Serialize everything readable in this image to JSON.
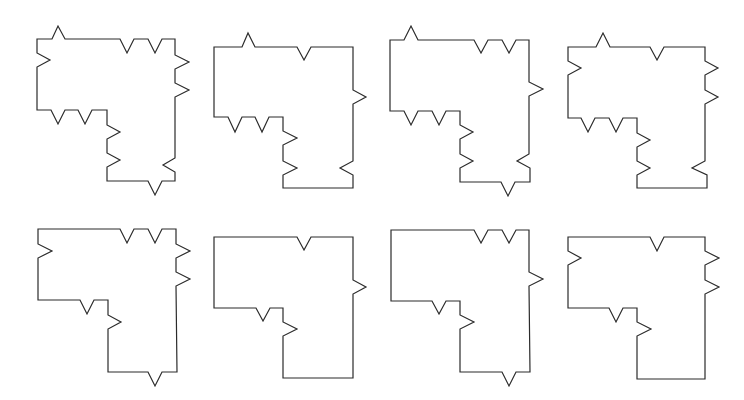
{
  "figure": {
    "width": 744,
    "height": 400,
    "stroke_color": "#2b2b2b",
    "background": "#ffffff"
  },
  "shapes": [
    {
      "id": "shape-1",
      "row": 1,
      "col": 1,
      "points": "37,39 52,39 58,26 65,39 120,39 127,53 134,39 148,39 155,53 162,39 175,39 175,55 189,62 175,69 175,83 189,90 175,97 175,158 163,165 175,172 175,181 162,181 155,195 148,181 107,181 107,167 120,160 107,153 107,139 120,132 107,125 107,110 92,110 85,124 78,110 65,110 58,124 51,110 37,110 37,67 50,60 37,53"
    },
    {
      "id": "shape-2",
      "row": 1,
      "col": 2,
      "points": "214,47 242,47 248,33 255,47 297,47 304,60 311,47 353,47 353,90 366,97 353,104 353,161 340,168 353,175 353,188 283,188 283,175 297,168 283,161 283,145 297,138 283,131 283,117 269,117 262,132 255,117 242,117 235,132 228,117 214,117"
    },
    {
      "id": "shape-3",
      "row": 1,
      "col": 3,
      "points": "390,40 404,40 411,26 418,40 474,40 481,53 488,40 502,40 509,53 516,40 529,40 529,82 543,89 529,96 529,154 517,161 530,168 530,182 515,182 508,196 501,182 460,182 460,168 473,161 460,154 460,139 473,132 460,125 460,111 446,111 439,125 432,111 418,111 411,125 404,111 390,111"
    },
    {
      "id": "shape-4",
      "row": 1,
      "col": 4,
      "points": "568,47 596,47 603,33 610,47 650,47 657,60 664,47 705,47 705,61 718,68 705,75 705,90 718,97 705,104 705,161 692,168 707,175 707,188 637,188 637,175 650,168 637,161 637,147 650,140 637,133 637,118 623,118 616,132 609,118 595,118 588,132 581,118 568,118 568,75 581,68 568,61"
    },
    {
      "id": "shape-5",
      "row": 2,
      "col": 1,
      "points": "38,229 120,229 127,243 134,229 148,229 155,243 162,229 176,229 176,244 190,251 176,258 176,272 190,279 176,286 177,372 162,372 155,386 148,372 108,372 108,329 121,322 108,315 108,300 94,300 87,314 80,300 38,300 38,258 52,251 38,244"
    },
    {
      "id": "shape-6",
      "row": 2,
      "col": 2,
      "points": "214,237 297,237 304,250 311,237 353,237 353,280 366,287 353,294 353,378 283,378 283,336 297,329 283,322 283,308 270,308 263,321 256,308 214,308"
    },
    {
      "id": "shape-7",
      "row": 2,
      "col": 3,
      "points": "391,230 474,230 481,243 488,230 502,230 509,243 516,230 529,230 529,272 543,279 529,286 530,372 516,372 509,386 502,372 460,372 460,329 474,322 460,315 460,301 446,301 439,314 432,301 391,301"
    },
    {
      "id": "shape-8",
      "row": 2,
      "col": 4,
      "points": "568,237 650,237 657,251 664,237 705,237 705,251 719,258 705,265 705,280 719,287 705,294 705,379 637,379 637,336 651,329 637,322 637,308 623,308 616,322 609,308 568,308 568,265 581,258 568,251"
    }
  ]
}
